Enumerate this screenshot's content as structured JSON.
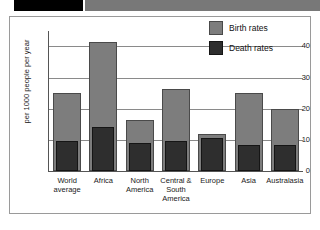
{
  "header": {
    "black_block": "black-bar",
    "grey_block": "grey-bar"
  },
  "legend": {
    "position": "top-right",
    "items": [
      {
        "label": "Birth rates",
        "color": "#7d7d7d",
        "swatch": "birth-rates-swatch"
      },
      {
        "label": "Death rates",
        "color": "#2e2e2e",
        "swatch": "death-rates-swatch"
      }
    ]
  },
  "axis": {
    "y_title": "per 1000 people per year",
    "y_ticks": [
      "0",
      "10",
      "20",
      "30",
      "40"
    ]
  },
  "chart_data": {
    "type": "bar",
    "title": "",
    "xlabel": "",
    "ylabel": "per 1000 people per year",
    "ylim": [
      0,
      44
    ],
    "yticks": [
      0,
      10,
      20,
      30,
      40
    ],
    "grid": true,
    "legend_position": "top-right",
    "categories": [
      "World average",
      "Africa",
      "North America",
      "Central & South America",
      "Europe",
      "Asia",
      "Australasia"
    ],
    "series": [
      {
        "name": "Birth rates",
        "color": "#7d7d7d",
        "values": [
          25,
          41.5,
          16.5,
          26.5,
          12,
          25,
          20
        ]
      },
      {
        "name": "Death rates",
        "color": "#2e2e2e",
        "values": [
          9.5,
          14,
          9,
          9.5,
          10.5,
          8.5,
          8.5
        ]
      }
    ]
  }
}
